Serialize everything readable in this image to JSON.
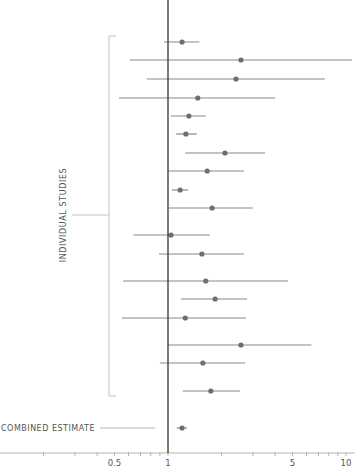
{
  "chart_data": {
    "type": "forest",
    "title": "",
    "xlabel": "",
    "ylabel": "",
    "xscale": "log",
    "xlim": [
      0.15,
      10
    ],
    "reference_line": 1,
    "x_ticks": [
      {
        "value": 0.2,
        "label": ""
      },
      {
        "value": 0.3,
        "label": ""
      },
      {
        "value": 0.4,
        "label": ""
      },
      {
        "value": 0.5,
        "label": "0.5"
      },
      {
        "value": 0.6,
        "label": ""
      },
      {
        "value": 0.7,
        "label": ""
      },
      {
        "value": 0.8,
        "label": ""
      },
      {
        "value": 0.9,
        "label": ""
      },
      {
        "value": 1,
        "label": "1"
      },
      {
        "value": 2,
        "label": ""
      },
      {
        "value": 3,
        "label": ""
      },
      {
        "value": 4,
        "label": ""
      },
      {
        "value": 5,
        "label": "5"
      },
      {
        "value": 6,
        "label": ""
      },
      {
        "value": 7,
        "label": ""
      },
      {
        "value": 8,
        "label": ""
      },
      {
        "value": 9,
        "label": ""
      },
      {
        "value": 10,
        "label": "10"
      }
    ],
    "group_label": "INDIVIDUAL STUDIES",
    "combined_label": "COMBINED ESTIMATE",
    "studies": [
      {
        "y": 42,
        "estimate": 1.2,
        "lower": 0.95,
        "upper": 1.5
      },
      {
        "y": 60,
        "estimate": 2.57,
        "lower": 0.61,
        "upper": 10.8
      },
      {
        "y": 79,
        "estimate": 2.41,
        "lower": 0.76,
        "upper": 7.6
      },
      {
        "y": 98,
        "estimate": 1.47,
        "lower": 0.53,
        "upper": 4.0
      },
      {
        "y": 116,
        "estimate": 1.31,
        "lower": 1.04,
        "upper": 1.63
      },
      {
        "y": 134,
        "estimate": 1.26,
        "lower": 1.11,
        "upper": 1.45
      },
      {
        "y": 153,
        "estimate": 2.09,
        "lower": 1.25,
        "upper": 3.51
      },
      {
        "y": 171,
        "estimate": 1.66,
        "lower": 1.0,
        "upper": 2.67
      },
      {
        "y": 190,
        "estimate": 1.17,
        "lower": 1.05,
        "upper": 1.3
      },
      {
        "y": 208,
        "estimate": 1.77,
        "lower": 1.01,
        "upper": 3.0
      },
      {
        "y": 235,
        "estimate": 1.04,
        "lower": 0.64,
        "upper": 1.72
      },
      {
        "y": 254,
        "estimate": 1.55,
        "lower": 0.89,
        "upper": 2.67
      },
      {
        "y": 281,
        "estimate": 1.63,
        "lower": 0.56,
        "upper": 4.72
      },
      {
        "y": 299,
        "estimate": 1.84,
        "lower": 1.18,
        "upper": 2.78
      },
      {
        "y": 318,
        "estimate": 1.25,
        "lower": 0.55,
        "upper": 2.74
      },
      {
        "y": 345,
        "estimate": 2.57,
        "lower": 1.0,
        "upper": 6.4
      },
      {
        "y": 363,
        "estimate": 1.57,
        "lower": 0.9,
        "upper": 2.71
      },
      {
        "y": 391,
        "estimate": 1.74,
        "lower": 1.21,
        "upper": 2.54
      }
    ],
    "combined": {
      "y": 428,
      "estimate": 1.2,
      "lower": 1.12,
      "upper": 1.28
    },
    "grid": false,
    "legend": null
  },
  "style": {
    "line_color": "#8a8a8a",
    "point_color": "#6e6e6e",
    "reference_color": "#333333",
    "axis_color": "#b5b5b5",
    "text_color": "#555555"
  }
}
